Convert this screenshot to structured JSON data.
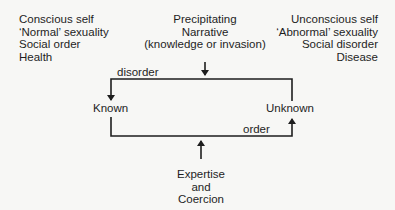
{
  "left_column": {
    "lines": [
      "Conscious self",
      "‘Normal’ sexuality",
      "Social order",
      "Health"
    ]
  },
  "right_column": {
    "lines": [
      "Unconscious self",
      "‘Abnormal’ sexuality",
      "Social disorder",
      "Disease"
    ]
  },
  "top_input": {
    "lines": [
      "Precipitating",
      "Narrative",
      "(knowledge or invasion)"
    ]
  },
  "bottom_input": {
    "lines": [
      "Expertise",
      "and",
      "Coercion"
    ]
  },
  "nodes": {
    "known": "Known",
    "unknown": "Unknown"
  },
  "edges": {
    "top": "disorder",
    "bottom": "order"
  }
}
